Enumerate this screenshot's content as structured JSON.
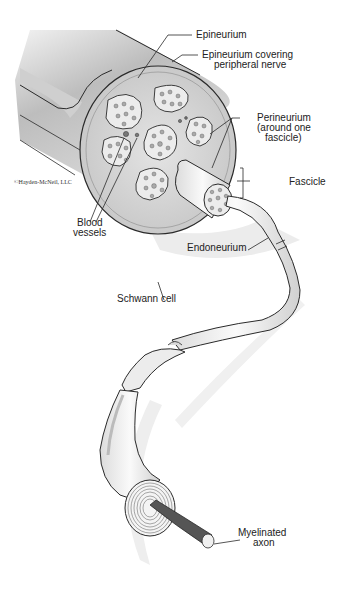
{
  "figure": {
    "copyright": "©Hayden-McNeil, LLC",
    "labels": {
      "epineurium": "Epineurium",
      "epineurium_covering_1": "Epineurium covering",
      "epineurium_covering_2": "peripheral nerve",
      "perineurium_1": "Perineurium",
      "perineurium_2": "(around one",
      "perineurium_3": "fascicle)",
      "fascicle": "Fascicle",
      "blood_vessels_1": "Blood",
      "blood_vessels_2": "vessels",
      "endoneurium": "Endoneurium",
      "schwann_cell": "Schwann cell",
      "myelinated_axon_1": "Myelinated",
      "myelinated_axon_2": "axon"
    },
    "colors": {
      "outline": "#2a2a2a",
      "nerve_fill": "#d9d9d9",
      "cross_section": "#c8c8c8",
      "fascicle_fill": "#ececec",
      "axon_core": "#555555",
      "shadow": "#e6e6e6"
    }
  }
}
